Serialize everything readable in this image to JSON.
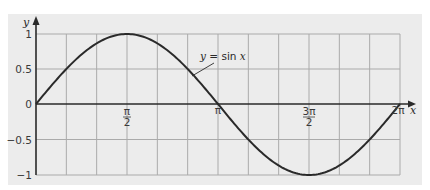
{
  "chart_data": {
    "type": "line",
    "title": "",
    "xlabel": "x",
    "ylabel": "y",
    "xlim": [
      0,
      6.2832
    ],
    "ylim": [
      -1,
      1
    ],
    "grid": true,
    "x_ticks": [
      {
        "value": 1.5708,
        "label_num": "π",
        "label_den": "2"
      },
      {
        "value": 3.1416,
        "label": "π"
      },
      {
        "value": 4.7124,
        "label_num": "3π",
        "label_den": "2"
      },
      {
        "value": 6.2832,
        "label": "2π"
      }
    ],
    "y_ticks": [
      {
        "value": 1,
        "label": "1"
      },
      {
        "value": 0.5,
        "label": "0.5"
      },
      {
        "value": 0,
        "label": "0"
      },
      {
        "value": -0.5,
        "label": "−0.5"
      },
      {
        "value": -1,
        "label": "−1"
      }
    ],
    "series": [
      {
        "name": "y = sin x",
        "x": [
          0,
          0.5236,
          1.0472,
          1.5708,
          2.0944,
          2.618,
          3.1416,
          3.6652,
          4.1888,
          4.7124,
          5.236,
          5.7596,
          6.2832
        ],
        "values": [
          0,
          0.5,
          0.866,
          1,
          0.866,
          0.5,
          0,
          -0.5,
          -0.866,
          -1,
          -0.866,
          -0.5,
          0
        ]
      }
    ],
    "annotations": [
      {
        "text_prefix": "y",
        "text_mid": " = sin ",
        "text_suffix": "x",
        "points_to_x": 2.4
      }
    ],
    "legend": "none"
  },
  "colors": {
    "panel_background": "#ececec",
    "grid": "#aaaaaa",
    "axes": "#2a2a2a",
    "curve": "#2a2a2a"
  }
}
